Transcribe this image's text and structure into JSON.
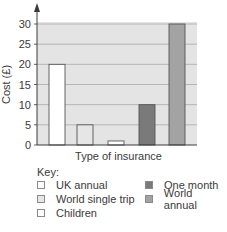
{
  "chart_data": {
    "type": "bar",
    "title": "",
    "xlabel": "Type of insurance",
    "ylabel": "Cost (£)",
    "ylim": [
      0,
      30
    ],
    "yticks": [
      0,
      5,
      10,
      15,
      20,
      25,
      30
    ],
    "grid": true,
    "legend_position": "below",
    "categories": [
      "UK annual",
      "World single trip",
      "Children",
      "One month",
      "World annual"
    ],
    "values": [
      20,
      5,
      1,
      10,
      30
    ],
    "colors": [
      "#ffffff",
      "#e6e6e6",
      "#ffffff",
      "#7a7a7a",
      "#a3a3a3"
    ],
    "legend": {
      "title": "Key:",
      "entries": [
        {
          "label": "UK annual",
          "color": "#ffffff"
        },
        {
          "label": "World single trip",
          "color": "#e6e6e6"
        },
        {
          "label": "Children",
          "color": "#ffffff"
        },
        {
          "label": "One month",
          "color": "#7a7a7a"
        },
        {
          "label": "World annual",
          "color": "#a3a3a3"
        }
      ]
    }
  },
  "style": {
    "plot_bg": "#e4e4e4",
    "grid_color": "#a8a8a8",
    "axis_color": "#3a3a3a",
    "bar_edge": "#555555"
  }
}
